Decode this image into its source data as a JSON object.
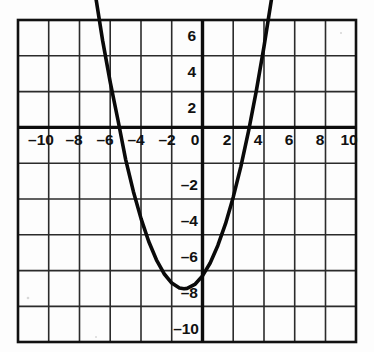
{
  "figure": {
    "name": "coordinate-plane-parabola",
    "background_color": "#fdfdfd",
    "grid_color": "#2b2b2b",
    "axis_color": "#0d0d0d",
    "curve_color": "#0a0a0a",
    "border_color": "#111111"
  },
  "chart_data": {
    "type": "line",
    "title": "",
    "xlabel": "",
    "ylabel": "",
    "xlim": [
      -11,
      11
    ],
    "ylim": [
      -11,
      7
    ],
    "grid": true,
    "legend": null,
    "x_tick_labels": [
      "–10",
      "–8",
      "–6",
      "–4",
      "–2",
      "0",
      "2",
      "4",
      "6",
      "8",
      "10"
    ],
    "x_tick_values": [
      -10,
      -8,
      -6,
      -4,
      -2,
      0,
      2,
      4,
      6,
      8,
      10
    ],
    "y_tick_labels": [
      "6",
      "4",
      "2",
      "–2",
      "–4",
      "–6",
      "–8",
      "–10"
    ],
    "y_tick_values": [
      6,
      4,
      2,
      -2,
      -4,
      -6,
      -8,
      -10
    ],
    "grid_step": 2,
    "curve": {
      "name": "parabola",
      "equation": "y = 0.5x^2 + 1.2x - 8.3",
      "a": 0.5,
      "b": 1.2,
      "c": -8.3,
      "vertex": [
        -1.2,
        -9.1
      ],
      "x_intercepts": [
        -5.27,
        2.87
      ],
      "y_intercept": -8.3,
      "x": [
        -7.1,
        -6.5,
        -6.0,
        -5.5,
        -5.0,
        -4.5,
        -4.0,
        -3.5,
        -3.0,
        -2.5,
        -2.0,
        -1.5,
        -1.2,
        -1.0,
        -0.5,
        0.0,
        0.5,
        1.0,
        1.5,
        2.0,
        2.5,
        3.0,
        3.5,
        4.0,
        4.5
      ],
      "y": [
        8.1,
        4.85,
        2.5,
        0.4,
        -1.8,
        -3.58,
        -5.1,
        -6.38,
        -7.4,
        -8.18,
        -8.7,
        -8.98,
        -9.02,
        -9.0,
        -8.78,
        -8.3,
        -7.58,
        -6.6,
        -5.38,
        -3.9,
        -2.18,
        -0.2,
        2.03,
        4.5,
        7.22
      ]
    }
  }
}
